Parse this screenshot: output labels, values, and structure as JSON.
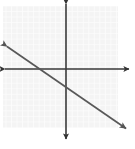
{
  "figure": {
    "width": 135,
    "height": 149,
    "background_color": "#ffffff"
  },
  "chart_data": {
    "type": "line",
    "title": "",
    "subtitle": "",
    "xlabel": "",
    "ylabel": "",
    "xlim": [
      -11.5,
      9.5
    ],
    "ylim": [
      -10.8,
      11.5
    ],
    "grid": true,
    "grid_spacing": 1,
    "legend": null,
    "tick_labels": {
      "x": [],
      "y": []
    },
    "annotations": [],
    "series": [
      {
        "name": "line",
        "kind": "infinite-line",
        "slope": -0.6923,
        "intercept": -2.909,
        "x_intercept": -4.2,
        "y_intercept": -2.9,
        "arrows_both_ends": true,
        "color": "#4a4a4a",
        "x": [
          -11.3,
          11.3
        ],
        "y": [
          4.9,
          -10.7
        ]
      }
    ]
  },
  "geometry": {
    "grid": {
      "left": 3,
      "top": 6,
      "right": 118,
      "bottom": 128,
      "cell_size": 5.52,
      "line_color": "#e3e3e3",
      "fill_color": "#f4f4f4"
    },
    "x_axis": {
      "y": 69,
      "start_x": 4,
      "end_x": 131,
      "color": "#3a3a3a",
      "stroke_width": 1.6,
      "arrow_left": true,
      "arrow_right": true
    },
    "y_axis": {
      "x": 66,
      "start_y": 2,
      "end_y": 141,
      "color": "#3a3a3a",
      "stroke_width": 1.6,
      "arrow_top": true,
      "arrow_bottom": true
    },
    "plotted_line": {
      "x1": 5,
      "y1": 45,
      "x2": 128,
      "y2": 130,
      "color": "#585858",
      "stroke_width": 1.7,
      "arrow_start": true,
      "arrow_end": true
    }
  },
  "labels": {
    "figure_caption": "",
    "x_axis_name": "x-axis",
    "y_axis_name": "y-axis",
    "line_name": "graphed line"
  }
}
